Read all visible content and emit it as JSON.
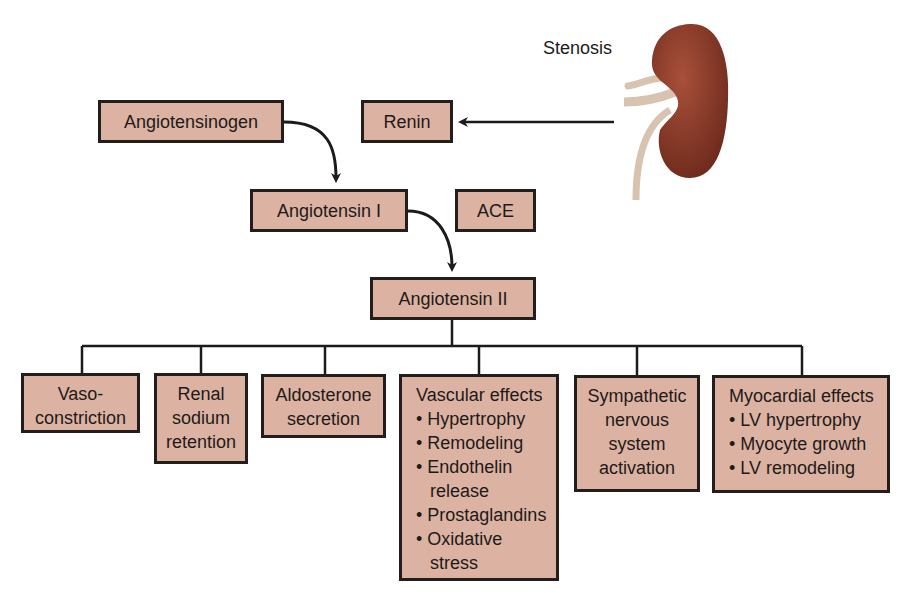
{
  "diagram": {
    "title_label": "Stenosis",
    "nodes": {
      "angiotensinogen": "Angiotensinogen",
      "renin": "Renin",
      "angiotensin_1": "Angiotensin I",
      "ace": "ACE",
      "angiotensin_2": "Angiotensin II"
    },
    "effects": [
      {
        "lines": [
          "Vaso-",
          "constriction"
        ]
      },
      {
        "lines": [
          "Renal",
          "sodium",
          "retention"
        ]
      },
      {
        "lines": [
          "Aldosterone",
          "secretion"
        ]
      },
      {
        "heading": "Vascular effects",
        "items": [
          "• Hypertrophy",
          "• Remodeling",
          "• Endothelin",
          "release",
          "• Prostaglandins",
          "• Oxidative",
          "stress"
        ]
      },
      {
        "lines": [
          "Sympathetic",
          "nervous",
          "system",
          "activation"
        ]
      },
      {
        "heading": "Myocardial effects",
        "items": [
          "• LV hypertrophy",
          "• Myocyte growth",
          "• LV remodeling"
        ]
      }
    ],
    "colors": {
      "box_fill": "#dcb3a3",
      "box_border": "#231d1b",
      "kidney": "#8a3524",
      "vessel": "#d8c3b0"
    }
  }
}
